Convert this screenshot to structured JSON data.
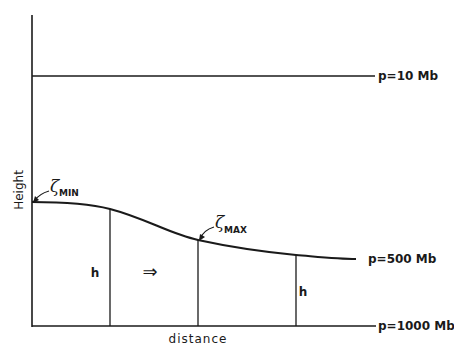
{
  "diagram": {
    "type": "schematic",
    "axes": {
      "y_label": "Height",
      "x_label": "distance"
    },
    "pressure_levels": [
      {
        "label": "p=10 Mb",
        "shape": "flat"
      },
      {
        "label": "p=500 Mb",
        "shape": "sloping curve, high on left, low on right"
      },
      {
        "label": "p=1000 Mb",
        "shape": "flat (baseline)"
      }
    ],
    "annotations": {
      "zeta_min": {
        "symbol": "ζ",
        "subscript": "MIN"
      },
      "zeta_max": {
        "symbol": "ζ",
        "subscript": "MAX"
      },
      "thickness_left": "h",
      "thickness_right": "h",
      "flow_arrow": "⇒"
    },
    "colors": {
      "line": "#1a1a1a",
      "background": "#ffffff"
    }
  }
}
